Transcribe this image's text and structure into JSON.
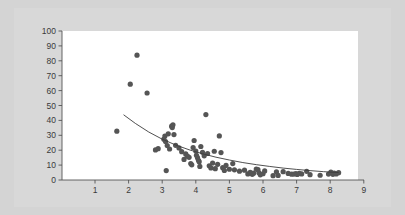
{
  "chart_data": {
    "type": "scatter",
    "title": "",
    "subtitle": "",
    "xlabel": "",
    "ylabel": "",
    "xlim": [
      0,
      9
    ],
    "ylim": [
      0,
      100
    ],
    "xticks": [
      0,
      1,
      2,
      3,
      4,
      5,
      6,
      7,
      8,
      9
    ],
    "xtick_labels": [
      "0",
      "1",
      "2",
      "3",
      "4",
      "5",
      "6",
      "7",
      "8",
      "9"
    ],
    "yticks": [
      0,
      10,
      20,
      30,
      40,
      50,
      60,
      70,
      80,
      90,
      100
    ],
    "ytick_labels": [
      "0",
      "10",
      "20",
      "30",
      "40",
      "50",
      "60",
      "70",
      "80",
      "90",
      "100"
    ],
    "grid": false,
    "legend": null,
    "legend_position": "none",
    "annotations": [],
    "marker_color": "#555555",
    "marker_size": 2.6,
    "plot_background": "#ffffff",
    "figure_background": "#d4d4d4",
    "axis_color": "#555555",
    "series": [
      {
        "name": "observations",
        "type": "scatter",
        "points": [
          [
            1.65,
            32.8
          ],
          [
            2.05,
            64.3
          ],
          [
            2.25,
            83.8
          ],
          [
            2.55,
            58.4
          ],
          [
            2.8,
            20.2
          ],
          [
            2.88,
            21.0
          ],
          [
            3.05,
            27.4
          ],
          [
            3.08,
            29.5
          ],
          [
            3.1,
            25.8
          ],
          [
            3.12,
            6.3
          ],
          [
            3.15,
            23.1
          ],
          [
            3.18,
            31.0
          ],
          [
            3.22,
            20.8
          ],
          [
            3.28,
            36.1
          ],
          [
            3.3,
            35.2
          ],
          [
            3.32,
            37.0
          ],
          [
            3.35,
            30.5
          ],
          [
            3.4,
            23.3
          ],
          [
            3.5,
            21.5
          ],
          [
            3.58,
            19.0
          ],
          [
            3.65,
            13.8
          ],
          [
            3.7,
            17.5
          ],
          [
            3.75,
            16.0
          ],
          [
            3.8,
            15.2
          ],
          [
            3.85,
            11.0
          ],
          [
            3.88,
            10.2
          ],
          [
            3.92,
            21.8
          ],
          [
            3.95,
            26.5
          ],
          [
            4.0,
            19.4
          ],
          [
            4.02,
            16.6
          ],
          [
            4.05,
            15.0
          ],
          [
            4.08,
            13.2
          ],
          [
            4.1,
            12.3
          ],
          [
            4.12,
            9.1
          ],
          [
            4.15,
            22.5
          ],
          [
            4.2,
            18.6
          ],
          [
            4.25,
            16.2
          ],
          [
            4.3,
            43.9
          ],
          [
            4.35,
            17.8
          ],
          [
            4.4,
            9.5
          ],
          [
            4.45,
            8.1
          ],
          [
            4.5,
            11.4
          ],
          [
            4.55,
            19.3
          ],
          [
            4.58,
            7.6
          ],
          [
            4.65,
            10.5
          ],
          [
            4.7,
            29.6
          ],
          [
            4.75,
            18.4
          ],
          [
            4.8,
            8.3
          ],
          [
            4.85,
            6.4
          ],
          [
            4.9,
            9.8
          ],
          [
            5.0,
            7.2
          ],
          [
            5.1,
            11.0
          ],
          [
            5.15,
            6.8
          ],
          [
            5.3,
            5.9
          ],
          [
            5.45,
            6.6
          ],
          [
            5.55,
            4.1
          ],
          [
            5.62,
            5.2
          ],
          [
            5.68,
            3.8
          ],
          [
            5.72,
            4.6
          ],
          [
            5.8,
            7.3
          ],
          [
            5.85,
            6.9
          ],
          [
            5.88,
            4.8
          ],
          [
            5.92,
            3.5
          ],
          [
            6.0,
            4.2
          ],
          [
            6.05,
            6.1
          ],
          [
            6.3,
            2.9
          ],
          [
            6.4,
            5.4
          ],
          [
            6.45,
            3.1
          ],
          [
            6.6,
            5.6
          ],
          [
            6.75,
            4.4
          ],
          [
            6.85,
            3.9
          ],
          [
            6.92,
            4.0
          ],
          [
            6.98,
            4.3
          ],
          [
            7.02,
            3.7
          ],
          [
            7.08,
            4.5
          ],
          [
            7.15,
            4.1
          ],
          [
            7.3,
            5.8
          ],
          [
            7.4,
            3.6
          ],
          [
            7.7,
            3.2
          ],
          [
            7.95,
            4.0
          ],
          [
            8.02,
            5.3
          ],
          [
            8.08,
            3.8
          ],
          [
            8.12,
            4.6
          ],
          [
            8.18,
            4.1
          ],
          [
            8.25,
            4.9
          ]
        ]
      },
      {
        "name": "fitted-curve",
        "type": "line",
        "color": "#3c3c3c",
        "width": 0.9,
        "x_start": 1.85,
        "x_end": 8.25,
        "model": "exponential-decay",
        "points": [
          [
            1.85,
            43.8
          ],
          [
            2.2,
            38.0
          ],
          [
            2.6,
            32.2
          ],
          [
            3.0,
            27.4
          ],
          [
            3.4,
            23.5
          ],
          [
            3.8,
            20.3
          ],
          [
            4.2,
            17.6
          ],
          [
            4.6,
            15.3
          ],
          [
            5.0,
            13.4
          ],
          [
            5.4,
            11.7
          ],
          [
            5.8,
            10.3
          ],
          [
            6.2,
            9.1
          ],
          [
            6.6,
            8.0
          ],
          [
            7.0,
            7.1
          ],
          [
            7.4,
            6.3
          ],
          [
            7.8,
            5.6
          ],
          [
            8.25,
            5.0
          ]
        ]
      }
    ]
  }
}
